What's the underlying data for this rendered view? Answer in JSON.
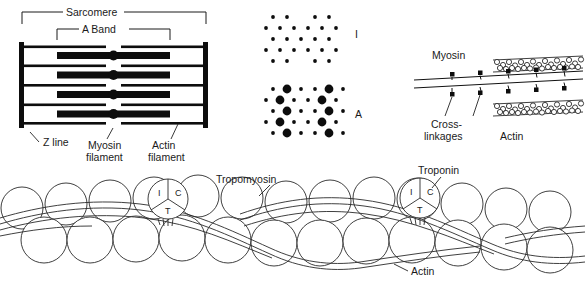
{
  "figure": {
    "title_present": false,
    "background": "#ffffff",
    "ink": "#1a1a1a"
  },
  "panel_sarcomere": {
    "brackets": [
      {
        "name": "sarcomere",
        "label": "Sarcomere"
      },
      {
        "name": "a-band",
        "label": "A Band"
      }
    ],
    "labels": [
      {
        "name": "z-line",
        "text": "Z line"
      },
      {
        "name": "myosin-filament",
        "line1": "Myosin",
        "line2": "filament"
      },
      {
        "name": "actin-filament",
        "line1": "Actin",
        "line2": "filament"
      }
    ],
    "structure": {
      "z_line_count": 2,
      "myosin_rows": 4,
      "actin_rows": 5,
      "m_line_dots": 4
    }
  },
  "panel_cross_sections": {
    "sections": [
      {
        "name": "i-band-section",
        "label": "I",
        "description": "actin only hexagonal lattice"
      },
      {
        "name": "a-band-section",
        "label": "A",
        "description": "myosin surrounded by actin hexagonal lattice"
      }
    ]
  },
  "panel_crossbridge": {
    "labels": [
      {
        "name": "myosin",
        "text": "Myosin"
      },
      {
        "name": "cross-linkages",
        "line1": "Cross-",
        "line2": "linkages"
      },
      {
        "name": "actin",
        "text": "Actin"
      }
    ],
    "myosin_rod_count": 2,
    "actin_strand_count": 2,
    "cross_bridges_per_rod": 5
  },
  "panel_thin_filament": {
    "labels": [
      {
        "name": "tropomyosin",
        "text": "Tropomyosin"
      },
      {
        "name": "troponin",
        "text": "Troponin"
      },
      {
        "name": "actin",
        "text": "Actin"
      }
    ],
    "troponin_complexes": [
      {
        "name": "troponin-complex-left",
        "subunits": [
          "I",
          "C",
          "T"
        ]
      },
      {
        "name": "troponin-complex-right",
        "subunits": [
          "I",
          "C",
          "T"
        ]
      }
    ],
    "actin_bead_rows": 2
  }
}
